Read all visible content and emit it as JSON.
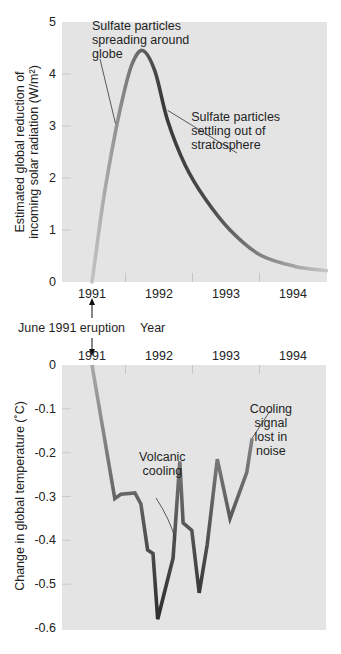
{
  "chart_data": [
    {
      "type": "line",
      "title": "",
      "xlabel": "Year",
      "ylabel": "Estimated global reduction of incoming solar radiation (W/m²)",
      "ylabel_lines": [
        "Estimated global reduction of",
        "incoming solar radiation (W/m²)"
      ],
      "ylim": [
        0,
        5
      ],
      "yticks": [
        0,
        1,
        2,
        3,
        4,
        5
      ],
      "xticks": [
        "1991",
        "1992",
        "1993",
        "1994"
      ],
      "xlim": [
        1990.99,
        1994.95
      ],
      "grid": false,
      "x": [
        1991.45,
        1991.61,
        1991.75,
        1991.9,
        1992.05,
        1992.21,
        1992.39,
        1992.58,
        1992.84,
        1993.14,
        1993.51,
        1993.96,
        1994.48,
        1994.95
      ],
      "values": [
        0,
        1.5,
        2.55,
        3.5,
        4.2,
        4.45,
        4.05,
        3.1,
        2.25,
        1.6,
        1.0,
        0.52,
        0.3,
        0.22
      ],
      "line_color_gradient": [
        "#b9b9b9",
        "#3a3a3a",
        "#bdbdbd"
      ],
      "annotations": [
        {
          "lines": [
            "Sulfate particles",
            "spreading around",
            "globe"
          ],
          "x": 1991.45,
          "y": 4.85,
          "pointer_to": [
            1991.8,
            3.05
          ]
        },
        {
          "lines": [
            "Sulfate particles",
            "settling out of",
            "stratosphere"
          ],
          "x": 1992.93,
          "y": 3.1,
          "pointer_to": [
            1992.58,
            3.3
          ]
        }
      ]
    },
    {
      "type": "line",
      "title": "",
      "xlabel": "",
      "ylabel": "Change in global temperature (°C)",
      "ylim": [
        -0.6,
        0
      ],
      "yticks": [
        0,
        -0.1,
        -0.2,
        -0.3,
        -0.4,
        -0.5,
        -0.6
      ],
      "ytick_labels": [
        "0",
        "-0.1",
        "-0.2",
        "-0.3",
        "-0.4",
        "-0.5",
        "-0.6"
      ],
      "xticks": [
        "1991",
        "1992",
        "1993",
        "1994"
      ],
      "xlim": [
        1990.99,
        1994.95
      ],
      "grid": false,
      "x": [
        1991.45,
        1991.79,
        1991.88,
        1992.09,
        1992.18,
        1992.28,
        1992.36,
        1992.43,
        1992.66,
        1992.76,
        1992.81,
        1992.94,
        1993.05,
        1993.17,
        1993.32,
        1993.51,
        1993.76,
        1993.84
      ],
      "values": [
        0,
        -0.305,
        -0.295,
        -0.292,
        -0.317,
        -0.422,
        -0.43,
        -0.58,
        -0.44,
        -0.22,
        -0.36,
        -0.377,
        -0.52,
        -0.41,
        -0.215,
        -0.35,
        -0.245,
        -0.167
      ],
      "line_color_gradient": [
        "#a9a9a9",
        "#3a3a3a",
        "#b0b0b0"
      ],
      "annotations": [
        {
          "lines": [
            "Volcanic",
            "cooling"
          ],
          "x": 1992.5,
          "y": -0.22,
          "pointer_to": [
            1992.7,
            -0.4
          ]
        },
        {
          "lines": [
            "Cooling",
            "signal",
            "lost in",
            "noise"
          ],
          "x": 1994.12,
          "y": -0.11,
          "pointer_to": [
            1993.84,
            -0.167
          ]
        }
      ]
    }
  ],
  "labels": {
    "eruption": "June 1991 eruption",
    "year": "Year",
    "top_ylabel_line1": "Estimated global reduction of",
    "top_ylabel_line2": "incoming solar radiation (W/m²)",
    "bottom_ylabel": "Change in global temperature (˚C)"
  },
  "colors": {
    "plot_background": "#e3e3e3",
    "axis_text": "#222222",
    "tick_mark": "#c8c8c8",
    "line_dark": "#3a3a3a",
    "line_light": "#b5b5b5"
  }
}
